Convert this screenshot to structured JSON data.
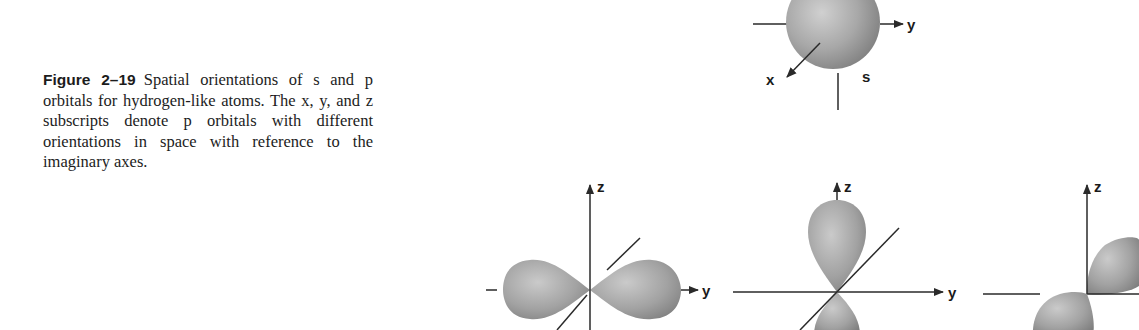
{
  "caption": {
    "label": "Figure 2–19",
    "text": "Spatial orientations of s and p orbitals for hydrogen-like atoms. The x, y, and z subscripts denote p orbitals with different orientations in space with reference to the imaginary axes."
  },
  "diagrams": {
    "s_orbital": {
      "name": "s",
      "axis_labels": {
        "x": "x",
        "y": "y"
      }
    },
    "p_orbital_1": {
      "axis_labels": {
        "z": "z",
        "y": "y"
      },
      "orientation": "along y"
    },
    "p_orbital_2": {
      "axis_labels": {
        "z": "z",
        "y": "y"
      },
      "orientation": "along z"
    },
    "p_orbital_3": {
      "axis_labels": {
        "z": "z"
      },
      "orientation": "along x (diagonal)"
    }
  },
  "colors": {
    "lobe_light": "#c4c4c4",
    "lobe_mid": "#9a9a9a",
    "lobe_dark": "#7a7a7a",
    "axis": "#2a2a2a",
    "text": "#1c1c1c"
  }
}
